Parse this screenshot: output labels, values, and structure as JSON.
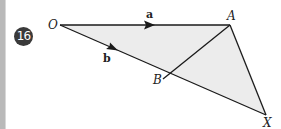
{
  "question": {
    "number": "16"
  },
  "figure": {
    "points": {
      "O": {
        "label": "O",
        "x": 60,
        "y": 25
      },
      "A": {
        "label": "A",
        "x": 230,
        "y": 25
      },
      "B": {
        "label": "B",
        "x": 163,
        "y": 79
      },
      "X": {
        "label": "X",
        "x": 266,
        "y": 115
      }
    },
    "vectors": {
      "a": {
        "label": "a",
        "from": "O",
        "to": "A"
      },
      "b": {
        "label": "b",
        "from": "O",
        "to": "B"
      }
    },
    "colors": {
      "fill": "#ececec",
      "line": "#1a1a1a",
      "badge": "#3a3a3a"
    }
  }
}
